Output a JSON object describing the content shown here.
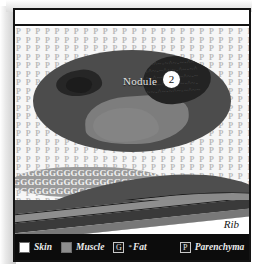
{
  "figure": {
    "nodule": {
      "label": "Nodule",
      "badge": "2"
    },
    "rib": {
      "label": "Rib"
    },
    "textures": {
      "parenchyma_glyph": "P",
      "fat_glyph": "G"
    },
    "colors": {
      "nodule_fill": "#4c4c4c",
      "nodule_inner": "#7d7d7d",
      "nodule_dark_blob": "#232323",
      "fat_fill": "#9a9a9a",
      "muscle_fill": "#8d8d8d",
      "skin_fill": "#ffffff",
      "legend_background": "#0c0c0c",
      "frame_stroke": "#141414"
    }
  },
  "legend": {
    "items": [
      {
        "name": "skin",
        "label": "Skin",
        "swatch_kind": "solid",
        "swatch_glyph": ""
      },
      {
        "name": "muscle",
        "label": "Muscle",
        "swatch_kind": "solid",
        "swatch_glyph": ""
      },
      {
        "name": "fat",
        "label": "Fat",
        "swatch_kind": "letter",
        "swatch_glyph": "G",
        "marker": "*"
      },
      {
        "name": "parenchyma",
        "label": "Parenchyma",
        "swatch_kind": "letter",
        "swatch_glyph": "P"
      }
    ]
  },
  "texture_rows": {
    "parenchyma": "P P P P P P P P P P P P P P P P P P P P P P P P P P P P P P P P P P P P P P P P P P P P",
    "fat": "GGGGGGGGGGGGGGGGGGGGGGGGGGGGGGGGG"
  },
  "blob_noise": "~~^~-~^~-~-^~~\n-^~-~^~~-^~-~^\n~-^~~-^~-~^~-~\n^~-~^~-^~~-^~-\n~~-^~-~^~-~^~~"
}
